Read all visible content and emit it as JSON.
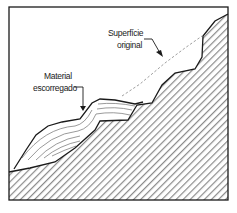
{
  "diagram": {
    "type": "landslide-cross-section",
    "labels": {
      "original_surface_line1": "Superfície",
      "original_surface_line2": "original",
      "slid_material_line1": "Material",
      "slid_material_line2": "escorregado"
    },
    "colors": {
      "outline": "#1a1a1a",
      "hatch": "#8a8a8a",
      "background": "#ffffff",
      "dashed_line": "#a0a0a0"
    }
  }
}
